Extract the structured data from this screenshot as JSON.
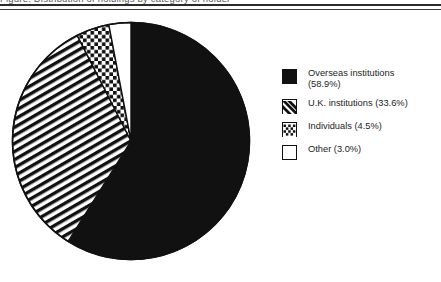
{
  "caption": {
    "text": "Figure: Distribution of holdings by category of holder"
  },
  "chart_data": {
    "type": "pie",
    "title": "",
    "categories": [
      "Overseas institutions",
      "U.K. institutions",
      "Individuals",
      "Other"
    ],
    "values": [
      58.9,
      33.6,
      4.5,
      3.0
    ],
    "value_unit": "%",
    "start_angle_deg": 0,
    "direction": "clockwise",
    "legend_position": "right",
    "grid": false,
    "slices": [
      {
        "label": "Overseas institutions",
        "value": 58.9,
        "fill": "solid-black",
        "legend_text": "Overseas institutions\n(58.9%)"
      },
      {
        "label": "U.K. institutions",
        "value": 33.6,
        "fill": "diagonal-lines",
        "legend_text": "U.K. institutions (33.6%)"
      },
      {
        "label": "Individuals",
        "value": 4.5,
        "fill": "dots",
        "legend_text": "Individuals (4.5%)"
      },
      {
        "label": "Other",
        "value": 3.0,
        "fill": "white",
        "legend_text": "Other (3.0%)"
      }
    ]
  },
  "colors": {
    "ink": "#111111",
    "paper": "#ffffff",
    "rule": "#2b2b2b"
  }
}
